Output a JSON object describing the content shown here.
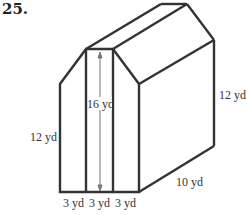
{
  "problem": {
    "number": "25."
  },
  "figure": {
    "type": "prism with pentagonal (house-shaped) base",
    "labels": {
      "front_height": "16 yd",
      "wall_height_left": "12 yd",
      "wall_height_right": "12 yd",
      "depth": "10 yd",
      "base_left": "3 yd",
      "base_middle": "3 yd",
      "base_right": "3 yd"
    },
    "colors": {
      "stroke": "#333333",
      "dimension_line": "#777777",
      "background": "#ffffff"
    }
  }
}
